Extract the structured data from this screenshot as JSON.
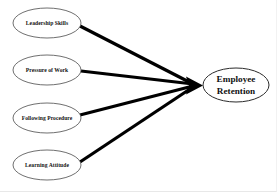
{
  "diagram": {
    "type": "path-model",
    "background_color": "#ffffff",
    "line_color": "#000000",
    "node_stroke_color": "#4a4a4a",
    "text_color": "#111111",
    "predictors": [
      {
        "id": "leadership-skills",
        "label": "Leadership Skills",
        "cx": 47,
        "cy": 23,
        "rx": 34,
        "ry": 15
      },
      {
        "id": "pressure-of-work",
        "label": "Pressure of Work",
        "cx": 47,
        "cy": 70,
        "rx": 34,
        "ry": 15
      },
      {
        "id": "following-procedure",
        "label": "Following Procedure",
        "cx": 47,
        "cy": 118,
        "rx": 34,
        "ry": 15
      },
      {
        "id": "learning-attitude",
        "label": "Learning Attitude",
        "cx": 47,
        "cy": 165,
        "rx": 34,
        "ry": 15
      }
    ],
    "outcome": {
      "id": "employee-retention",
      "label_line1": "Employee",
      "label_line2": "Retention",
      "cx": 236,
      "cy": 85,
      "rx": 33,
      "ry": 17
    },
    "arrows": [
      {
        "id": "arrow-leadership-skills",
        "from": "leadership-skills",
        "to": "employee-retention",
        "x1": 80,
        "y1": 26,
        "x2": 193,
        "y2": 84
      },
      {
        "id": "arrow-pressure-of-work",
        "from": "pressure-of-work",
        "to": "employee-retention",
        "x1": 81,
        "y1": 71,
        "x2": 193,
        "y2": 84
      },
      {
        "id": "arrow-following-procedure",
        "from": "following-procedure",
        "to": "employee-retention",
        "x1": 80,
        "y1": 115,
        "x2": 193,
        "y2": 86
      },
      {
        "id": "arrow-learning-attitude",
        "from": "learning-attitude",
        "to": "employee-retention",
        "x1": 80,
        "y1": 162,
        "x2": 193,
        "y2": 87
      }
    ],
    "arrow_head": {
      "id": "convergence-arrowhead",
      "tip_x": 203,
      "tip_y": 85.5,
      "back_x": 186,
      "half_height": 9
    }
  }
}
